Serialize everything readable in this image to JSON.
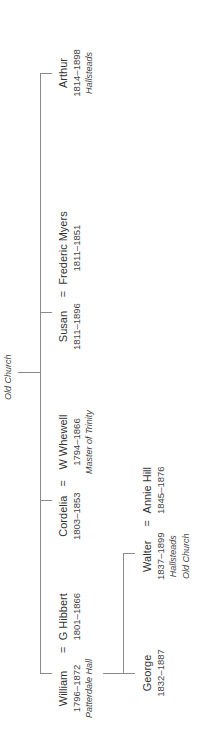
{
  "root_place": "Old Church",
  "children": [
    {
      "name": "Arthur",
      "dates": "1814–1898",
      "place": "Hallsteads"
    },
    {
      "name": "Susan",
      "dates": "1811–1896",
      "spouse": {
        "name": "Frederic Myers",
        "dates": "1811–1851"
      }
    },
    {
      "name": "Cordelia",
      "dates": "1803–1853",
      "spouse": {
        "name": "W Whewell",
        "dates": "1794–1866",
        "place": "Master of Trinity"
      }
    },
    {
      "name": "William",
      "dates": "1796–1872",
      "place": "Patterdale Hall",
      "spouse": {
        "name": "G Hibbert",
        "dates": "1801–1866"
      }
    }
  ],
  "grandchildren": [
    {
      "name": "Walter",
      "dates": "1837–1899",
      "place1": "Hallsteads",
      "place2": "Old Church",
      "spouse": {
        "name": "Annie Hill",
        "dates": "1845–1876"
      }
    },
    {
      "name": "George",
      "dates": "1832–1887"
    }
  ],
  "equals": "="
}
